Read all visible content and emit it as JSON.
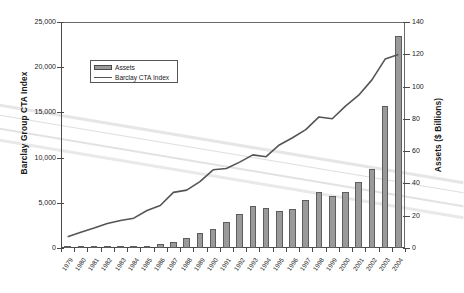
{
  "chart_data": {
    "type": "bar",
    "title": "",
    "subtitle": "",
    "xlabel": "",
    "ylabel": "Barclay Group CTA Index",
    "y2label": "Assets ($ Billions)",
    "ylim": [
      0,
      25000
    ],
    "y2lim": [
      0,
      140
    ],
    "grid": false,
    "legend_position": "upper-left",
    "yticks": [
      "0",
      "5,000",
      "10,000",
      "15,000",
      "20,000",
      "25,000"
    ],
    "ytick_values": [
      0,
      5000,
      10000,
      15000,
      20000,
      25000
    ],
    "y2ticks": [
      "0",
      "20",
      "40",
      "60",
      "80",
      "100",
      "120",
      "140"
    ],
    "y2tick_values": [
      0,
      20,
      40,
      60,
      80,
      100,
      120,
      140
    ],
    "categories": [
      "1979",
      "1980",
      "1981",
      "1982",
      "1983",
      "1984",
      "1985",
      "1986",
      "1987",
      "1988",
      "1989",
      "1990",
      "1991",
      "1992",
      "1993",
      "1994",
      "1995",
      "1996",
      "1997",
      "1998",
      "1999",
      "2000",
      "2001",
      "2002",
      "2003",
      "2004"
    ],
    "series": [
      {
        "name": "Assets",
        "type": "bar",
        "axis": "right",
        "unit": "$ Billions",
        "color": "#9a9a9a",
        "values": [
          0.3,
          0.4,
          0.6,
          0.8,
          1.0,
          1.2,
          1.5,
          2.2,
          3.8,
          6.5,
          9.5,
          11.5,
          16.0,
          21.0,
          26.0,
          24.5,
          23.0,
          24.0,
          30.0,
          34.5,
          32.5,
          34.5,
          41.0,
          49.0,
          88.0,
          131.5
        ]
      },
      {
        "name": "Barclay CTA Index",
        "type": "line",
        "axis": "left",
        "color": "#555555",
        "values": [
          1250,
          1750,
          2200,
          2700,
          3050,
          3300,
          4150,
          4700,
          6150,
          6400,
          7350,
          8650,
          8800,
          9500,
          10300,
          10100,
          11400,
          12200,
          13100,
          14500,
          14300,
          15700,
          16900,
          18600,
          20900,
          21400
        ]
      }
    ],
    "legend": [
      {
        "label": "Assets",
        "marker": "bar-swatch"
      },
      {
        "label": "Barclay CTA Index",
        "marker": "line-swatch"
      }
    ]
  }
}
